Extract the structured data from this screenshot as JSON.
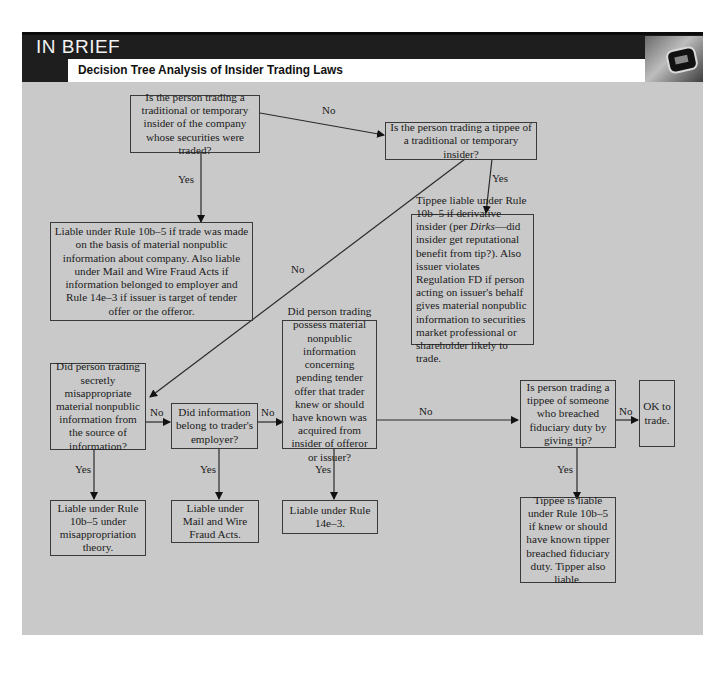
{
  "header": {
    "section_label": "IN BRIEF",
    "title": "Decision Tree Analysis of Insider Trading Laws",
    "badge_icon": "stopwatch-icon"
  },
  "colors": {
    "panel_bg": "#c9c9c9",
    "header_bg": "#1e1e1e",
    "box_border": "#3a3a3a"
  },
  "nodes": {
    "q_insider": "Is the person trading a traditional or temporary insider of the company whose securities were traded?",
    "q_tippee": "Is the person trading a tippee of a traditional or temporary insider?",
    "r_insider_liable": "Liable under Rule 10b–5 if trade was made on the basis of material nonpublic information about company. Also liable under Mail and Wire Fraud Acts if information belonged to employer and Rule 14e–3 if issuer is target of tender offer or the offeror.",
    "r_tippee_liable_pre": "Tippee liable under Rule 10b–5 if derivative insider (per ",
    "r_tippee_liable_case": "Dirks",
    "r_tippee_liable_post": "—did insider get reputational benefit from tip?). Also issuer violates Regulation FD if person acting on issuer's behalf gives material nonpublic information to securities market professional or shareholder likely to trade.",
    "q_misappropriate": "Did person trading secretly misappropriate material nonpublic information from the source of information?",
    "q_employer": "Did information belong to trader's employer?",
    "q_tender": "Did person trading possess material nonpublic information concerning pending tender offer that trader knew or should have known was acquired from insider of offeror or issuer?",
    "q_breach_tippee": "Is person trading a tippee of someone who breached fiduciary duty by giving tip?",
    "r_ok": "OK to trade.",
    "r_misappropriation": "Liable under Rule 10b–5 under misappropriation theory.",
    "r_mail_wire": "Liable under Mail and Wire Fraud Acts.",
    "r_14e3": "Liable under Rule 14e–3.",
    "r_breach_tippee": "Tippee is liable under Rule 10b–5 if knew or should have known tipper breached fiduciary duty. Tipper also liable."
  },
  "edges": {
    "insider_no": "No",
    "insider_yes": "Yes",
    "tippee_yes": "Yes",
    "tippee_no": "No",
    "misappropriate_no": "No",
    "misappropriate_yes": "Yes",
    "employer_no": "No",
    "employer_yes": "Yes",
    "tender_no": "No",
    "tender_yes": "Yes",
    "breach_no": "No",
    "breach_yes": "Yes"
  }
}
